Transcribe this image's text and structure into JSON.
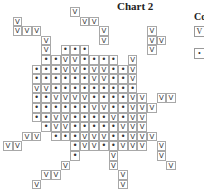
{
  "chart_data": {
    "type": "table",
    "title": "Chart 2",
    "legend_title": "Co",
    "legend": [
      {
        "symbol": "V",
        "label": ""
      },
      {
        "symbol": "•",
        "label": ""
      }
    ],
    "cell_size_px": 9.6,
    "grid_origin": {
      "x": 3,
      "y": 7
    },
    "symbols": {
      "V": "check",
      "•": "dot"
    },
    "rows": [
      {
        "r": 0,
        "cells": [
          [
            7,
            "V"
          ]
        ]
      },
      {
        "r": 1,
        "cells": [
          [
            1,
            "V"
          ],
          [
            8,
            "V"
          ],
          [
            9,
            "V"
          ]
        ]
      },
      {
        "r": 2,
        "cells": [
          [
            1,
            "V"
          ],
          [
            2,
            "V"
          ],
          [
            3,
            "V"
          ],
          [
            10,
            "V"
          ],
          [
            15,
            "V"
          ]
        ]
      },
      {
        "r": 3,
        "cells": [
          [
            4,
            "V"
          ],
          [
            10,
            "V"
          ],
          [
            15,
            "V"
          ],
          [
            16,
            "V"
          ]
        ]
      },
      {
        "r": 4,
        "cells": [
          [
            4,
            "V"
          ],
          [
            6,
            "•"
          ],
          [
            7,
            "•"
          ],
          [
            8,
            "•"
          ],
          [
            15,
            "V"
          ]
        ]
      },
      {
        "r": 5,
        "cells": [
          [
            4,
            "•"
          ],
          [
            5,
            "•"
          ],
          [
            6,
            "V"
          ],
          [
            7,
            "V"
          ],
          [
            8,
            "•"
          ],
          [
            9,
            "•"
          ],
          [
            10,
            "•"
          ],
          [
            11,
            "•"
          ],
          [
            13,
            "V"
          ]
        ]
      },
      {
        "r": 6,
        "cells": [
          [
            3,
            "•"
          ],
          [
            4,
            "•"
          ],
          [
            5,
            "•"
          ],
          [
            6,
            "V"
          ],
          [
            7,
            "V"
          ],
          [
            8,
            "•"
          ],
          [
            9,
            "V"
          ],
          [
            10,
            "V"
          ],
          [
            11,
            "•"
          ],
          [
            12,
            "•"
          ],
          [
            13,
            "V"
          ]
        ]
      },
      {
        "r": 7,
        "cells": [
          [
            3,
            "•"
          ],
          [
            4,
            "•"
          ],
          [
            5,
            "•"
          ],
          [
            6,
            "•"
          ],
          [
            7,
            "•"
          ],
          [
            8,
            "•"
          ],
          [
            9,
            "V"
          ],
          [
            10,
            "V"
          ],
          [
            11,
            "•"
          ],
          [
            12,
            "•"
          ],
          [
            13,
            "V"
          ]
        ]
      },
      {
        "r": 8,
        "cells": [
          [
            3,
            "V"
          ],
          [
            4,
            "V"
          ],
          [
            5,
            "•"
          ],
          [
            6,
            "•"
          ],
          [
            7,
            "•"
          ],
          [
            8,
            "•"
          ],
          [
            9,
            "•"
          ],
          [
            10,
            "•"
          ],
          [
            11,
            "•"
          ],
          [
            12,
            "•"
          ],
          [
            13,
            "•"
          ]
        ]
      },
      {
        "r": 9,
        "cells": [
          [
            3,
            "•"
          ],
          [
            4,
            "•"
          ],
          [
            5,
            "V"
          ],
          [
            6,
            "V"
          ],
          [
            7,
            "V"
          ],
          [
            8,
            "V"
          ],
          [
            9,
            "•"
          ],
          [
            10,
            "•"
          ],
          [
            11,
            "•"
          ],
          [
            12,
            "•"
          ],
          [
            13,
            "V"
          ],
          [
            14,
            "V"
          ],
          [
            16,
            "V"
          ],
          [
            17,
            "V"
          ]
        ]
      },
      {
        "r": 10,
        "cells": [
          [
            3,
            "•"
          ],
          [
            4,
            "•"
          ],
          [
            5,
            "•"
          ],
          [
            6,
            "•"
          ],
          [
            7,
            "•"
          ],
          [
            8,
            "•"
          ],
          [
            9,
            "V"
          ],
          [
            10,
            "V"
          ],
          [
            11,
            "•"
          ],
          [
            12,
            "•"
          ],
          [
            13,
            "V"
          ],
          [
            14,
            "V"
          ],
          [
            15,
            "V"
          ]
        ]
      },
      {
        "r": 11,
        "cells": [
          [
            3,
            "•"
          ],
          [
            4,
            "•"
          ],
          [
            5,
            "V"
          ],
          [
            6,
            "V"
          ],
          [
            7,
            "•"
          ],
          [
            8,
            "•"
          ],
          [
            9,
            "•"
          ],
          [
            10,
            "•"
          ],
          [
            11,
            "V"
          ],
          [
            12,
            "•"
          ],
          [
            13,
            "V"
          ],
          [
            14,
            "V"
          ]
        ]
      },
      {
        "r": 12,
        "cells": [
          [
            4,
            "•"
          ],
          [
            5,
            "V"
          ],
          [
            6,
            "V"
          ],
          [
            7,
            "•"
          ],
          [
            8,
            "•"
          ],
          [
            9,
            "•"
          ],
          [
            10,
            "•"
          ],
          [
            11,
            "•"
          ],
          [
            12,
            "V"
          ],
          [
            13,
            "V"
          ],
          [
            14,
            "V"
          ]
        ]
      },
      {
        "r": 13,
        "cells": [
          [
            2,
            "V"
          ],
          [
            3,
            "V"
          ],
          [
            5,
            "•"
          ],
          [
            6,
            "•"
          ],
          [
            7,
            "•"
          ],
          [
            8,
            "V"
          ],
          [
            9,
            "V"
          ],
          [
            10,
            "V"
          ],
          [
            11,
            "•"
          ],
          [
            12,
            "•"
          ],
          [
            13,
            "V"
          ],
          [
            14,
            "V"
          ],
          [
            15,
            "V"
          ]
        ]
      },
      {
        "r": 14,
        "cells": [
          [
            0,
            "V"
          ],
          [
            1,
            "V"
          ],
          [
            7,
            "•"
          ],
          [
            8,
            "V"
          ],
          [
            9,
            "V"
          ],
          [
            10,
            "•"
          ],
          [
            11,
            "•"
          ],
          [
            12,
            "V"
          ],
          [
            13,
            "V"
          ],
          [
            14,
            "V"
          ],
          [
            16,
            "V"
          ]
        ]
      },
      {
        "r": 15,
        "cells": [
          [
            7,
            "•"
          ],
          [
            11,
            "V"
          ],
          [
            16,
            "V"
          ]
        ]
      },
      {
        "r": 16,
        "cells": [
          [
            6,
            "V"
          ],
          [
            11,
            "V"
          ],
          [
            17,
            "V"
          ]
        ]
      },
      {
        "r": 17,
        "cells": [
          [
            4,
            "V"
          ],
          [
            5,
            "V"
          ],
          [
            12,
            "V"
          ]
        ]
      },
      {
        "r": 18,
        "cells": [
          [
            3,
            "V"
          ],
          [
            12,
            "V"
          ]
        ]
      }
    ]
  },
  "title": "Chart 2",
  "legend": {
    "title": "Co",
    "items": [
      {
        "symbol": "V"
      },
      {
        "symbol": "•"
      }
    ]
  }
}
